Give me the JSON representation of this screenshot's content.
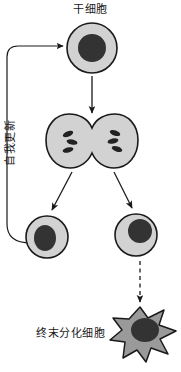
{
  "figure": {
    "type": "cell-lineage-diagram",
    "background_color": "#ffffff",
    "labels": {
      "stem_cell": "干细胞",
      "self_renewal": "自我更新",
      "terminal_cell": "终末分化细胞"
    },
    "colors": {
      "cytoplasm": "#d2d2d2",
      "cytoplasm_differentiated": "#9a9a9a",
      "nucleus": "#333333",
      "outline": "#1a1a1a",
      "text": "#1a1a1a"
    },
    "nodes": [
      {
        "id": "stem-cell",
        "name": "stem-cell",
        "label": "干细胞",
        "shape": "circle",
        "cx": 92,
        "cy": 48,
        "r": 25,
        "nucleus": {
          "cx": 92,
          "cy": 48,
          "rx": 14,
          "ry": 14
        }
      },
      {
        "id": "dividing-cell",
        "name": "dividing-cell",
        "label": "",
        "shape": "binary-fission",
        "cx": 92,
        "cy": 145,
        "chromosomes": 6
      },
      {
        "id": "daughter-cell-left",
        "name": "daughter-cell-left",
        "label": "",
        "shape": "circle",
        "cx": 47,
        "cy": 237,
        "r": 21,
        "nucleus": {
          "cx": 45,
          "cy": 238,
          "rx": 11,
          "ry": 13
        }
      },
      {
        "id": "daughter-cell-right",
        "name": "daughter-cell-right",
        "label": "",
        "shape": "circle",
        "cx": 136,
        "cy": 235,
        "r": 21,
        "nucleus": {
          "cx": 140,
          "cy": 231,
          "rx": 12,
          "ry": 12
        }
      },
      {
        "id": "terminal-cell",
        "name": "terminally-differentiated-cell",
        "label": "终末分化细胞",
        "shape": "star",
        "cx": 140,
        "cy": 333,
        "nucleus": {
          "cx": 145,
          "cy": 330,
          "rx": 14,
          "ry": 12
        }
      }
    ],
    "edges": [
      {
        "id": "arrow-self-renewal",
        "name": "self-renewal-loop-arrow",
        "style": "solid",
        "label": "自我更新",
        "from": "daughter-cell-left",
        "to": "stem-cell"
      },
      {
        "id": "arrow-stem-to-division",
        "name": "stem-to-division-arrow",
        "style": "solid",
        "label": "",
        "from": "stem-cell",
        "to": "dividing-cell"
      },
      {
        "id": "arrow-division-left",
        "name": "division-to-left-daughter-arrow",
        "style": "solid",
        "label": "",
        "from": "dividing-cell",
        "to": "daughter-cell-left"
      },
      {
        "id": "arrow-division-right",
        "name": "division-to-right-daughter-arrow",
        "style": "solid",
        "label": "",
        "from": "dividing-cell",
        "to": "daughter-cell-right"
      },
      {
        "id": "arrow-differentiation",
        "name": "differentiation-arrow",
        "style": "dashed",
        "label": "",
        "from": "daughter-cell-right",
        "to": "terminal-cell"
      }
    ]
  }
}
